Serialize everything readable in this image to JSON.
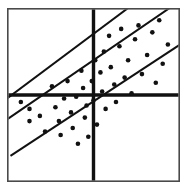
{
  "figure": {
    "title": "",
    "background_color": "#ffffff",
    "frame": {
      "name": "plot-frame",
      "x": 7,
      "y": 8,
      "width": 173,
      "height": 174,
      "stroke_color": "#4a4a4a",
      "stroke_width": 1.6
    }
  },
  "chart_data": {
    "type": "scatter",
    "title": "",
    "subtitle": "",
    "xlabel": "",
    "ylabel": "",
    "xlim": [
      0,
      100
    ],
    "ylim": [
      0,
      100
    ],
    "grid": false,
    "legend": null,
    "axes_style": "quadrant-cross",
    "quadrant_axes": {
      "name": "quadrant-axes",
      "x_center": 50,
      "y_center": 50,
      "stroke_color": "#111111",
      "stroke_width": 3.4
    },
    "lines": [
      {
        "name": "upper-band-line",
        "label": "Upper band",
        "x0": 0,
        "y0": 48,
        "x1": 70,
        "y1": 100,
        "slope": 0.74,
        "stroke_color": "#111111",
        "stroke_width": 2.0
      },
      {
        "name": "fit-line",
        "label": "Fitted line",
        "x0": 0,
        "y0": 36,
        "x1": 94,
        "y1": 100,
        "slope": 0.68,
        "stroke_color": "#111111",
        "stroke_width": 2.0
      },
      {
        "name": "lower-band-line",
        "label": "Lower band",
        "x0": 2,
        "y0": 15,
        "x1": 100,
        "y1": 79,
        "slope": 0.65,
        "stroke_color": "#111111",
        "stroke_width": 2.0
      }
    ],
    "point_style": {
      "marker": "filled-circle",
      "radius": 2.3,
      "color": "#111111"
    },
    "points": [
      {
        "x": 8,
        "y": 46
      },
      {
        "x": 13,
        "y": 42
      },
      {
        "x": 13,
        "y": 35
      },
      {
        "x": 19,
        "y": 38
      },
      {
        "x": 22,
        "y": 29
      },
      {
        "x": 26,
        "y": 55
      },
      {
        "x": 28,
        "y": 43
      },
      {
        "x": 30,
        "y": 35
      },
      {
        "x": 31,
        "y": 27
      },
      {
        "x": 33,
        "y": 48
      },
      {
        "x": 35,
        "y": 58
      },
      {
        "x": 37,
        "y": 40
      },
      {
        "x": 38,
        "y": 31
      },
      {
        "x": 40,
        "y": 49
      },
      {
        "x": 41,
        "y": 22
      },
      {
        "x": 43,
        "y": 64
      },
      {
        "x": 44,
        "y": 54
      },
      {
        "x": 45,
        "y": 37
      },
      {
        "x": 46,
        "y": 44
      },
      {
        "x": 47,
        "y": 26
      },
      {
        "x": 49,
        "y": 58
      },
      {
        "x": 50,
        "y": 47
      },
      {
        "x": 51,
        "y": 70
      },
      {
        "x": 52,
        "y": 33
      },
      {
        "x": 54,
        "y": 63
      },
      {
        "x": 55,
        "y": 52
      },
      {
        "x": 56,
        "y": 75
      },
      {
        "x": 57,
        "y": 42
      },
      {
        "x": 59,
        "y": 84
      },
      {
        "x": 60,
        "y": 66
      },
      {
        "x": 62,
        "y": 56
      },
      {
        "x": 63,
        "y": 46
      },
      {
        "x": 65,
        "y": 78
      },
      {
        "x": 66,
        "y": 88
      },
      {
        "x": 68,
        "y": 60
      },
      {
        "x": 70,
        "y": 70
      },
      {
        "x": 72,
        "y": 51
      },
      {
        "x": 74,
        "y": 82
      },
      {
        "x": 76,
        "y": 90
      },
      {
        "x": 78,
        "y": 62
      },
      {
        "x": 81,
        "y": 73
      },
      {
        "x": 84,
        "y": 86
      },
      {
        "x": 86,
        "y": 57
      },
      {
        "x": 88,
        "y": 93
      },
      {
        "x": 90,
        "y": 68
      },
      {
        "x": 93,
        "y": 79
      }
    ]
  }
}
